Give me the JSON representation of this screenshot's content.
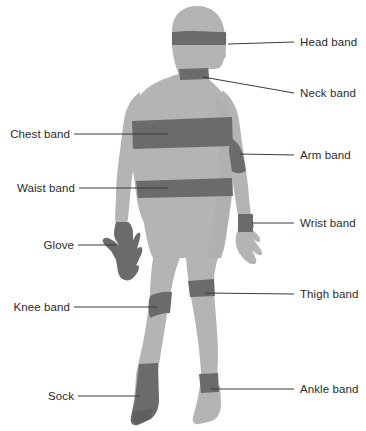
{
  "diagram": {
    "figure_name": "human-body-silhouette",
    "view": "rear view, head turned to the right",
    "colors": {
      "background": "#ffffff",
      "body_fill": "#b4b4b4",
      "body_shadow": "#a8a8a8",
      "band_fill": "#6b6b6b",
      "leader_line": "#3a3a3a",
      "label_text": "#2b2b2b"
    },
    "labels": {
      "head_band": "Head band",
      "neck_band": "Neck band",
      "arm_band": "Arm band",
      "wrist_band": "Wrist band",
      "thigh_band": "Thigh band",
      "ankle_band": "Ankle band",
      "chest_band": "Chest band",
      "waist_band": "Waist band",
      "glove": "Glove",
      "knee_band": "Knee band",
      "sock": "Sock"
    },
    "callouts": [
      {
        "key": "head_band",
        "label": "Head band",
        "side": "right",
        "label_x": 300,
        "label_y": 36,
        "line": [
          230,
          44,
          294,
          42
        ]
      },
      {
        "key": "neck_band",
        "label": "Neck band",
        "side": "right",
        "label_x": 300,
        "label_y": 87,
        "line": [
          204,
          77,
          294,
          93
        ]
      },
      {
        "key": "arm_band",
        "label": "Arm band",
        "side": "right",
        "label_x": 300,
        "label_y": 149,
        "line": [
          238,
          153,
          294,
          155
        ]
      },
      {
        "key": "wrist_band",
        "label": "Wrist band",
        "side": "right",
        "label_x": 300,
        "label_y": 217,
        "line": [
          255,
          224,
          294,
          224
        ]
      },
      {
        "key": "thigh_band",
        "label": "Thigh band",
        "side": "right",
        "label_x": 300,
        "label_y": 288,
        "line": [
          214,
          293,
          294,
          294
        ]
      },
      {
        "key": "ankle_band",
        "label": "Ankle band",
        "side": "right",
        "label_x": 300,
        "label_y": 385,
        "line": [
          209,
          389,
          294,
          389
        ]
      },
      {
        "key": "chest_band",
        "label": "Chest band",
        "side": "left",
        "label_x": 14,
        "label_y": 128,
        "line": [
          74,
          134,
          164,
          134
        ]
      },
      {
        "key": "waist_band",
        "label": "Waist band",
        "side": "left",
        "label_x": 14,
        "label_y": 182,
        "line": [
          79,
          188,
          165,
          188
        ]
      },
      {
        "key": "glove",
        "label": "Glove",
        "side": "left",
        "label_x": 39,
        "label_y": 239,
        "line": [
          78,
          245,
          114,
          245
        ]
      },
      {
        "key": "knee_band",
        "label": "Knee band",
        "side": "left",
        "label_x": 14,
        "label_y": 301,
        "line": [
          74,
          307,
          155,
          307
        ]
      },
      {
        "key": "sock",
        "label": "Sock",
        "side": "left",
        "label_x": 46,
        "label_y": 390,
        "line": [
          78,
          396,
          138,
          396
        ]
      }
    ]
  }
}
